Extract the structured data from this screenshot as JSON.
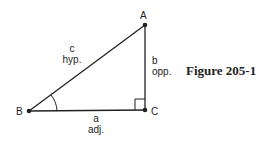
{
  "figure": {
    "caption": "Figure 205-1",
    "vertices": {
      "A": {
        "label": "A",
        "x": 145,
        "y": 25
      },
      "B": {
        "label": "B",
        "x": 29,
        "y": 111
      },
      "C": {
        "label": "C",
        "x": 145,
        "y": 110
      }
    },
    "sides": {
      "c": {
        "letter": "c",
        "name": "hyp."
      },
      "b": {
        "letter": "b",
        "name": "opp."
      },
      "a": {
        "letter": "a",
        "name": "adj."
      }
    },
    "line_color": "#222222"
  }
}
